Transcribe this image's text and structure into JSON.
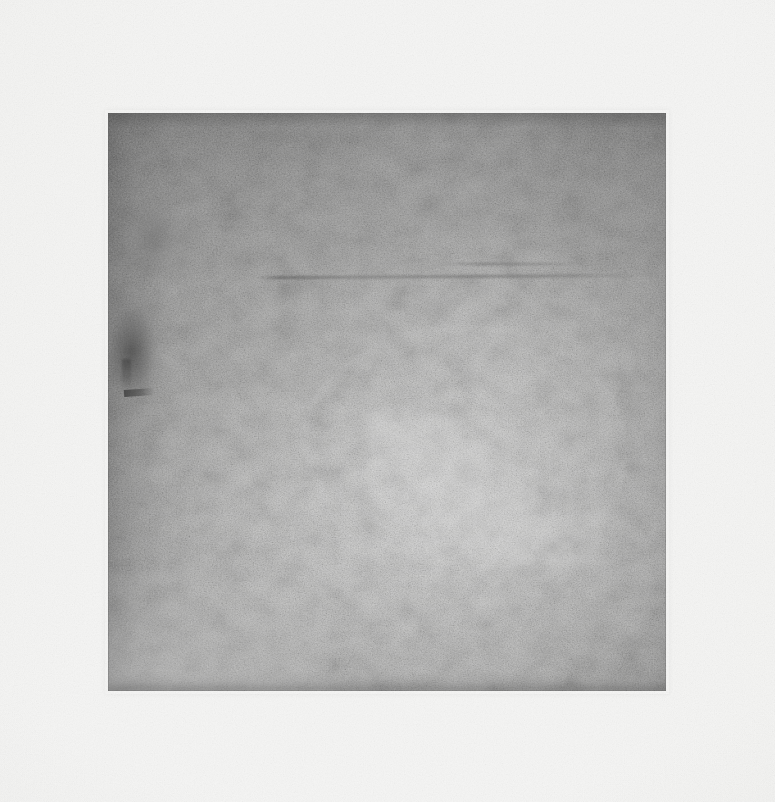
{
  "page": {
    "width": 775,
    "height": 802,
    "background_color": "#f5f5f4",
    "medium": "scanned monochrome print on paper"
  },
  "plate": {
    "label": "untitled monochrome plate",
    "x": 108,
    "y": 113,
    "width": 558,
    "height": 578,
    "base_color": "#acacab",
    "darkest_color": "#6e6e6e",
    "lightest_color": "#d2d2d1",
    "description": "Grainy square field of uniform grey aquatint tone, darker along the top band and left edge, lightening toward the lower centre and right.",
    "features": [
      {
        "name": "dark-smudge-left",
        "note": "dark blotch at the upper-left edge"
      },
      {
        "name": "horizontal-scratch",
        "note": "faint horizontal scratch across the upper third"
      },
      {
        "name": "tick-mark",
        "note": "small dark hook near the left edge"
      },
      {
        "name": "burnished-arc",
        "note": "faint lighter arc through the middle"
      },
      {
        "name": "corner-sweep",
        "note": "light diagonal sweep at the lower-left corner"
      }
    ]
  },
  "caption": {
    "text": "",
    "legible": false,
    "note": "a very faint, illegible line of printed text below the plate"
  }
}
